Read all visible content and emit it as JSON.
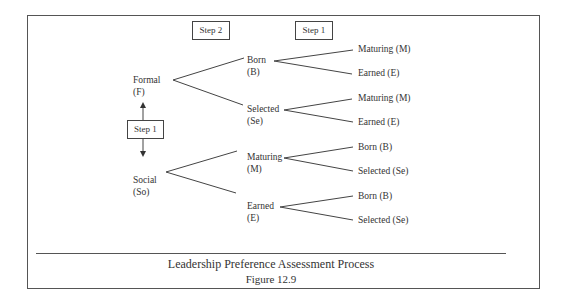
{
  "diagram": {
    "step_headers": {
      "step2": "Step 2",
      "step1": "Step 1"
    },
    "center_step": "Step 1",
    "roots": [
      {
        "label": "Formal",
        "abbr": "(F)"
      },
      {
        "label": "Social",
        "abbr": "(So)"
      }
    ],
    "mid_nodes": [
      {
        "label": "Born",
        "abbr": "(B)",
        "parent": "Formal"
      },
      {
        "label": "Selected",
        "abbr": "(Se)",
        "parent": "Formal"
      },
      {
        "label": "Maturing",
        "abbr": "(M)",
        "parent": "Social"
      },
      {
        "label": "Earned",
        "abbr": "(E)",
        "parent": "Social"
      }
    ],
    "leaves": [
      {
        "label": "Maturing (M)",
        "parent": "Born"
      },
      {
        "label": "Earned (E)",
        "parent": "Born"
      },
      {
        "label": "Maturing (M)",
        "parent": "Selected"
      },
      {
        "label": "Earned (E)",
        "parent": "Selected"
      },
      {
        "label": "Born (B)",
        "parent": "Maturing"
      },
      {
        "label": "Selected (Se)",
        "parent": "Maturing"
      },
      {
        "label": "Born (B)",
        "parent": "Earned"
      },
      {
        "label": "Selected (Se)",
        "parent": "Earned"
      }
    ]
  },
  "caption": {
    "title": "Leadership Preference Assessment Process",
    "figure": "Figure 12.9"
  }
}
